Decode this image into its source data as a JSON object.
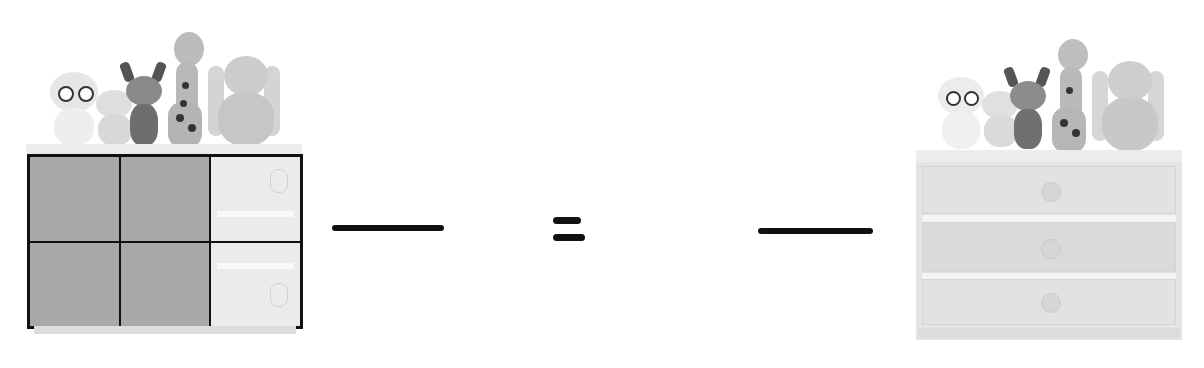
{
  "worksheet": {
    "type": "equivalent-fractions-picture",
    "left_figure": {
      "object": "dresser-with-toys",
      "grid": {
        "rows": 2,
        "columns": 3,
        "total_parts": 6,
        "shaded_parts": 4,
        "shaded_cells": [
          [
            0,
            0
          ],
          [
            0,
            1
          ],
          [
            1,
            0
          ],
          [
            1,
            1
          ]
        ]
      },
      "shade_color": "#a9a9a9"
    },
    "left_fraction": {
      "numerator": "",
      "denominator": ""
    },
    "operator": "=",
    "right_fraction": {
      "numerator": "",
      "denominator": ""
    },
    "right_figure": {
      "object": "dresser-with-toys",
      "drawers": 3
    },
    "toys": [
      "owl",
      "lamb",
      "deer",
      "giraffe",
      "bunny"
    ]
  }
}
